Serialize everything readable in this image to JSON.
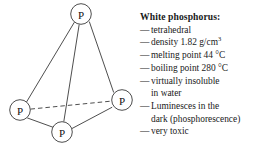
{
  "diagram": {
    "name": "white-phosphorus-p4-tetrahedron",
    "vertex_label": "P",
    "vertices": [
      {
        "id": "top",
        "label": "P",
        "x": 81,
        "y": 14,
        "r": 10.5
      },
      {
        "id": "left",
        "label": "P",
        "x": 20,
        "y": 110,
        "r": 10.5
      },
      {
        "id": "right",
        "label": "P",
        "x": 122,
        "y": 100,
        "r": 10.5
      },
      {
        "id": "bottom",
        "label": "P",
        "x": 62,
        "y": 132,
        "r": 10.5
      }
    ],
    "edges": [
      {
        "from": "top",
        "to": "left",
        "style": "solid"
      },
      {
        "from": "top",
        "to": "right",
        "style": "solid"
      },
      {
        "from": "top",
        "to": "bottom",
        "style": "solid"
      },
      {
        "from": "left",
        "to": "bottom",
        "style": "solid"
      },
      {
        "from": "right",
        "to": "bottom",
        "style": "solid"
      },
      {
        "from": "left",
        "to": "right",
        "style": "dashed"
      }
    ],
    "stroke_color": "#3a3a3a",
    "circle_fill": "#ffffff"
  },
  "info": {
    "title": "White phosphorus:",
    "dash": "—",
    "properties": [
      {
        "text": "tetrahedral"
      },
      {
        "text": "density 1.82 g/cm",
        "sup": "3"
      },
      {
        "text": "melting point 44 °C"
      },
      {
        "text": "boiling point 280 °C"
      },
      {
        "text": "virtually insoluble",
        "cont": "in water"
      },
      {
        "text": "Luminesces in the",
        "cont": "dark (phosphorescence)"
      },
      {
        "text": "very toxic"
      }
    ]
  }
}
